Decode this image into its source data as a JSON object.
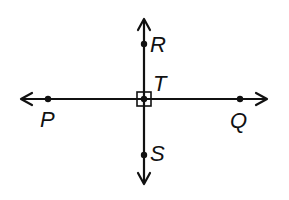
{
  "diagram": {
    "colors": {
      "stroke": "#111111",
      "background": "#ffffff"
    },
    "lines": [
      {
        "name": "line-PQ",
        "through": [
          "P",
          "Q"
        ],
        "orientation": "horizontal",
        "arrows": "both"
      },
      {
        "name": "line-RS",
        "through": [
          "R",
          "S"
        ],
        "orientation": "vertical",
        "arrows": "both"
      }
    ],
    "points": {
      "R": {
        "label": "R",
        "x": 144,
        "y": 44
      },
      "T": {
        "label": "T",
        "x": 144,
        "y": 99
      },
      "S": {
        "label": "S",
        "x": 144,
        "y": 155
      },
      "P": {
        "label": "P",
        "x": 48,
        "y": 99
      },
      "Q": {
        "label": "Q",
        "x": 240,
        "y": 99
      }
    },
    "right_angle_marker": {
      "at": "T",
      "size": 14
    }
  }
}
